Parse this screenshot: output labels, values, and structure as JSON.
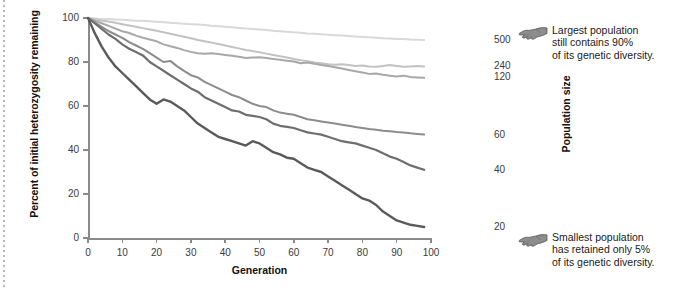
{
  "axes": {
    "ylabel": "Percent of initial heterozygosity remaining",
    "xlabel": "Generation",
    "yticks": [
      "0",
      "20",
      "40",
      "60",
      "80",
      "100"
    ],
    "xticks": [
      "0",
      "10",
      "20",
      "30",
      "40",
      "50",
      "60",
      "70",
      "80",
      "90",
      "100"
    ],
    "right_axis_label": "Population size"
  },
  "population_labels": [
    {
      "label": "500"
    },
    {
      "label": "240"
    },
    {
      "label": "120"
    },
    {
      "label": "60"
    },
    {
      "label": "40"
    },
    {
      "label": "20"
    }
  ],
  "annotations": [
    {
      "icon": "pointing-hand-left-icon",
      "text": "Largest population\nstill contains 90%\nof its genetic diversity."
    },
    {
      "icon": "pointing-hand-left-icon",
      "text": "Smallest population\nhas retained only 5%\nof its genetic diversity."
    }
  ],
  "chart_data": {
    "type": "line",
    "title": "",
    "xlabel": "Generation",
    "ylabel": "Percent of initial heterozygosity remaining",
    "xlim": [
      0,
      100
    ],
    "ylim": [
      0,
      100
    ],
    "grid": false,
    "legend_position": "right-axis-labels",
    "x": [
      0,
      2,
      4,
      6,
      8,
      10,
      12,
      14,
      16,
      18,
      20,
      22,
      24,
      26,
      28,
      30,
      32,
      34,
      36,
      38,
      40,
      42,
      44,
      46,
      48,
      50,
      52,
      54,
      56,
      58,
      60,
      62,
      64,
      66,
      68,
      70,
      72,
      74,
      76,
      78,
      80,
      82,
      84,
      86,
      88,
      90,
      92,
      94,
      96,
      98
    ],
    "series": [
      {
        "name": "500",
        "population_size": 500,
        "color": "#d9d9d9",
        "final_value": 90,
        "values": [
          100,
          99.8,
          99.6,
          99.5,
          99.3,
          99.2,
          99.0,
          98.8,
          98.7,
          98.5,
          98.3,
          98.1,
          97.8,
          97.6,
          97.4,
          97.2,
          97.0,
          96.8,
          96.5,
          96.3,
          96.0,
          95.8,
          95.5,
          95.2,
          95.0,
          94.8,
          94.5,
          94.2,
          94.0,
          93.8,
          93.5,
          93.3,
          93.0,
          92.8,
          92.6,
          92.4,
          92.2,
          92.0,
          91.8,
          91.6,
          91.4,
          91.2,
          91.0,
          90.8,
          90.7,
          90.5,
          90.4,
          90.2,
          90.1,
          90.0
        ]
      },
      {
        "name": "240",
        "population_size": 240,
        "color": "#c2c2c2",
        "final_value": 78,
        "values": [
          100,
          99.4,
          98.8,
          98.4,
          97.8,
          97.2,
          96.6,
          96.0,
          95.4,
          94.8,
          94.2,
          93.5,
          92.8,
          92.2,
          91.5,
          90.8,
          90.0,
          89.4,
          88.8,
          88.2,
          87.5,
          86.8,
          86.2,
          85.5,
          85.0,
          84.4,
          83.8,
          83.2,
          82.6,
          82.0,
          81.4,
          80.8,
          80.4,
          79.8,
          79.4,
          79.0,
          78.8,
          79.0,
          78.6,
          78.2,
          78.4,
          78.0,
          77.8,
          78.2,
          78.6,
          78.2,
          77.8,
          78.0,
          78.2,
          78.0
        ]
      },
      {
        "name": "120",
        "population_size": 120,
        "color": "#a8a8a8",
        "final_value": 73,
        "values": [
          100,
          98.8,
          97.6,
          96.4,
          95.2,
          94.0,
          93.2,
          92.0,
          91.0,
          90.2,
          89.4,
          88.0,
          87.2,
          86.4,
          85.4,
          84.6,
          84.0,
          83.8,
          84.0,
          83.6,
          83.2,
          82.8,
          82.4,
          81.8,
          82.0,
          82.2,
          81.8,
          81.4,
          81.0,
          80.6,
          80.2,
          79.4,
          79.8,
          79.2,
          78.6,
          78.2,
          77.6,
          77.0,
          76.4,
          75.8,
          75.2,
          74.6,
          74.8,
          74.2,
          73.8,
          73.4,
          73.8,
          73.2,
          73.0,
          72.8
        ]
      },
      {
        "name": "60",
        "population_size": 60,
        "color": "#8c8c8c",
        "final_value": 47,
        "values": [
          100,
          98.0,
          96.0,
          94.0,
          92.5,
          91.0,
          89.0,
          87.5,
          86.0,
          84.0,
          82.0,
          80.0,
          80.5,
          78.0,
          76.0,
          74.0,
          73.0,
          71.0,
          69.5,
          68.0,
          66.5,
          65.0,
          64.0,
          62.5,
          61.0,
          60.0,
          59.5,
          58.0,
          57.0,
          56.5,
          56.0,
          55.0,
          54.0,
          53.5,
          53.0,
          52.5,
          52.0,
          51.5,
          51.0,
          50.5,
          50.0,
          49.5,
          49.2,
          48.8,
          48.5,
          48.2,
          48.0,
          47.6,
          47.3,
          47.0
        ]
      },
      {
        "name": "40",
        "population_size": 40,
        "color": "#6e6e6e",
        "final_value": 31,
        "values": [
          100,
          97.5,
          95.0,
          92.5,
          90.5,
          88.0,
          86.0,
          84.5,
          83.0,
          80.0,
          78.0,
          76.0,
          74.0,
          72.0,
          70.0,
          68.0,
          66.5,
          64.0,
          62.5,
          61.0,
          59.5,
          58.0,
          57.5,
          56.0,
          55.5,
          55.0,
          54.0,
          52.0,
          51.0,
          50.5,
          50.0,
          49.0,
          48.0,
          47.5,
          47.0,
          46.0,
          45.0,
          44.0,
          43.5,
          43.0,
          42.0,
          41.0,
          40.0,
          38.5,
          37.0,
          36.0,
          34.5,
          33.0,
          32.0,
          31.0
        ]
      },
      {
        "name": "20",
        "population_size": 20,
        "color": "#5a5a5a",
        "final_value": 5,
        "values": [
          100,
          93.0,
          87.0,
          82.0,
          78.0,
          75.0,
          72.0,
          69.0,
          66.0,
          63.0,
          61.0,
          63.0,
          62.0,
          60.0,
          58.0,
          55.0,
          52.0,
          50.0,
          48.0,
          46.0,
          45.0,
          44.0,
          43.0,
          42.0,
          44.0,
          43.0,
          41.0,
          39.0,
          38.0,
          36.5,
          36.0,
          34.0,
          32.0,
          31.0,
          30.0,
          28.0,
          26.0,
          24.0,
          22.0,
          20.0,
          18.0,
          17.0,
          15.0,
          12.0,
          10.0,
          8.0,
          7.0,
          6.0,
          5.5,
          5.0
        ]
      }
    ]
  }
}
